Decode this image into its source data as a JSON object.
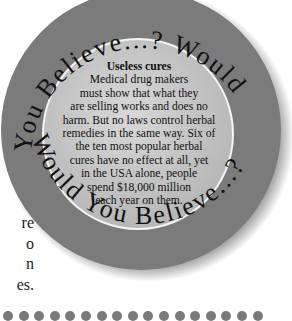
{
  "side_text": {
    "lines": [
      "re",
      "o",
      "n",
      "es."
    ]
  },
  "badge": {
    "ring_text_top": "You Believe...? Would",
    "ring_text_bottom": "Would You Believe...?",
    "ring_color": "#7b7b7b",
    "inner_color": "#c8c8c8",
    "title": "Useless cures",
    "body_lines": [
      "Medical drug makers",
      "must show that what they",
      "are selling works and does no",
      "harm. But no laws control herbal",
      "remedies in the same way. Six of",
      "the ten most popular herbal",
      "cures have no effect at all, yet",
      "in the USA alone, people",
      "spend $18,000 million",
      "each year on them."
    ]
  },
  "divider": {
    "dot_count": 17,
    "dot_color": "#7a7a7a"
  }
}
